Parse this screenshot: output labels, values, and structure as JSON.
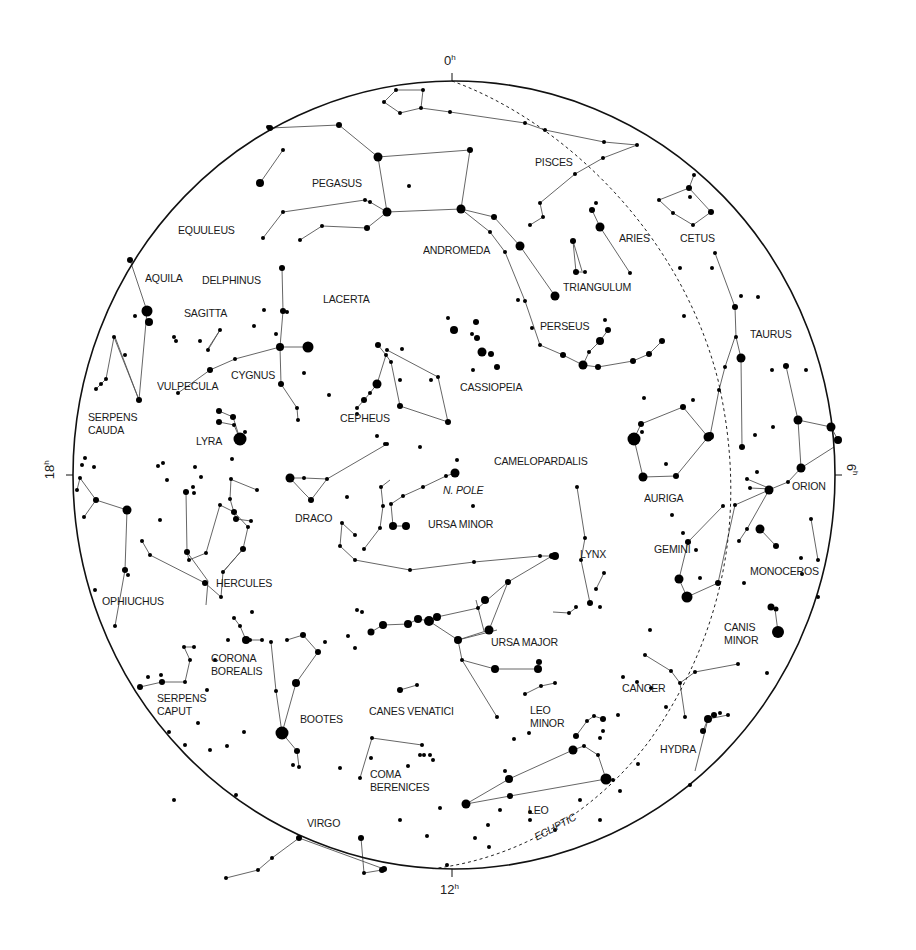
{
  "chart_data": {
    "type": "diagram",
    "title": "",
    "hour_labels": [
      {
        "text": "0",
        "sup": "h",
        "x": 444,
        "y": 58,
        "rot": 0
      },
      {
        "text": "6",
        "sup": "h",
        "x": 848,
        "y": 468,
        "rot": 90
      },
      {
        "text": "12",
        "sup": "h",
        "x": 440,
        "y": 888,
        "rot": 0
      },
      {
        "text": "18",
        "sup": "h",
        "x": 46,
        "y": 468,
        "rot": -90
      }
    ],
    "circle": {
      "cx": 454,
      "cy": 475,
      "rx": 381,
      "ry": 394
    },
    "ecliptic_label": "ECLIPTIC",
    "pole_label": "N. POLE",
    "constellations": [
      {
        "name": "PISCES",
        "x": 535,
        "y": 156
      },
      {
        "name": "PEGASUS",
        "x": 312,
        "y": 177
      },
      {
        "name": "CETUS",
        "x": 680,
        "y": 232
      },
      {
        "name": "ARIES",
        "x": 619,
        "y": 232
      },
      {
        "name": "EQUULEUS",
        "x": 178,
        "y": 224
      },
      {
        "name": "ANDROMEDA",
        "x": 423,
        "y": 244
      },
      {
        "name": "AQUILA",
        "x": 145,
        "y": 272
      },
      {
        "name": "DELPHINUS",
        "x": 202,
        "y": 274
      },
      {
        "name": "TRIANGULUM",
        "x": 563,
        "y": 281
      },
      {
        "name": "LACERTA",
        "x": 323,
        "y": 293
      },
      {
        "name": "SAGITTA",
        "x": 184,
        "y": 307
      },
      {
        "name": "PERSEUS",
        "x": 540,
        "y": 320
      },
      {
        "name": "TAURUS",
        "x": 750,
        "y": 328
      },
      {
        "name": "CYGNUS",
        "x": 231,
        "y": 369
      },
      {
        "name": "VULPECULA",
        "x": 157,
        "y": 380
      },
      {
        "name": "CASSIOPEIA",
        "x": 460,
        "y": 381
      },
      {
        "name": "SERPENS\nCAUDA",
        "x": 88,
        "y": 411
      },
      {
        "name": "CEPHEUS",
        "x": 340,
        "y": 412
      },
      {
        "name": "LYRA",
        "x": 196,
        "y": 435
      },
      {
        "name": "CAMELOPARDALIS",
        "x": 494,
        "y": 455
      },
      {
        "name": "N. POLE",
        "x": 443,
        "y": 484,
        "italic": true
      },
      {
        "name": "ORION",
        "x": 792,
        "y": 480
      },
      {
        "name": "AURIGA",
        "x": 644,
        "y": 492
      },
      {
        "name": "DRACO",
        "x": 295,
        "y": 512
      },
      {
        "name": "URSA MINOR",
        "x": 428,
        "y": 518
      },
      {
        "name": "GEMINI",
        "x": 654,
        "y": 543
      },
      {
        "name": "LYNX",
        "x": 580,
        "y": 548
      },
      {
        "name": "MONOCEROS",
        "x": 750,
        "y": 565
      },
      {
        "name": "HERCULES",
        "x": 216,
        "y": 577
      },
      {
        "name": "OPHIUCHUS",
        "x": 102,
        "y": 595
      },
      {
        "name": "CANIS\nMINOR",
        "x": 724,
        "y": 621
      },
      {
        "name": "URSA MAJOR",
        "x": 491,
        "y": 636
      },
      {
        "name": "CORONA\nBOREALIS",
        "x": 211,
        "y": 652
      },
      {
        "name": "CANCER",
        "x": 622,
        "y": 682
      },
      {
        "name": "SERPENS\nCAPUT",
        "x": 157,
        "y": 692
      },
      {
        "name": "LEO\nMINOR",
        "x": 530,
        "y": 704
      },
      {
        "name": "CANES VENATICI",
        "x": 369,
        "y": 705
      },
      {
        "name": "BOOTES",
        "x": 300,
        "y": 713
      },
      {
        "name": "HYDRA",
        "x": 660,
        "y": 743
      },
      {
        "name": "COMA\nBERENICES",
        "x": 370,
        "y": 768
      },
      {
        "name": "LEO",
        "x": 528,
        "y": 804
      },
      {
        "name": "VIRGO",
        "x": 307,
        "y": 817
      }
    ]
  }
}
